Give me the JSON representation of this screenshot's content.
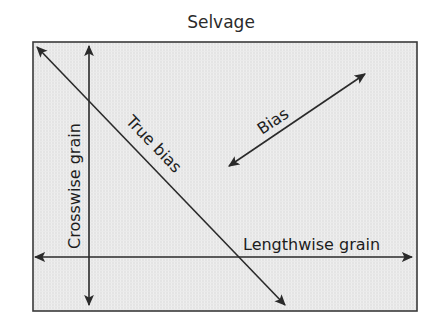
{
  "diagram": {
    "type": "fabric-grain-diagram",
    "title": "Selvage",
    "labels": {
      "selvage": "Selvage",
      "crosswise_grain": "Crosswise grain",
      "lengthwise_grain": "Lengthwise grain",
      "true_bias": "True bias",
      "bias": "Bias"
    },
    "colors": {
      "fabric_fill": "#e4e4e4",
      "fabric_stripe": "#f2f2f2",
      "outline": "#3a3a3a",
      "arrow": "#2a2a2a",
      "text": "#1d1d1d",
      "title_text": "#2b2b2b",
      "background": "#ffffff"
    },
    "fabric_rect": {
      "x": 33,
      "y": 42,
      "width": 384,
      "height": 269
    },
    "arrows": [
      {
        "name": "crosswise-grain-arrow",
        "orientation": "vertical",
        "double_headed": true,
        "x1": 89,
        "y1": 44,
        "x2": 89,
        "y2": 307,
        "label": "Crosswise grain",
        "label_rotation_deg": -90
      },
      {
        "name": "lengthwise-grain-arrow",
        "orientation": "horizontal",
        "double_headed": true,
        "x1": 33,
        "y1": 257,
        "x2": 414,
        "y2": 257,
        "label": "Lengthwise grain",
        "label_rotation_deg": 0
      },
      {
        "name": "true-bias-arrow",
        "orientation": "diagonal-descending",
        "double_headed": true,
        "x1": 35,
        "y1": 45,
        "x2": 287,
        "y2": 307,
        "label": "True bias",
        "label_rotation_deg": 46
      },
      {
        "name": "bias-arrow",
        "orientation": "diagonal-ascending",
        "double_headed": true,
        "x1": 227,
        "y1": 168,
        "x2": 367,
        "y2": 72,
        "label": "Bias",
        "label_rotation_deg": -34
      }
    ]
  }
}
